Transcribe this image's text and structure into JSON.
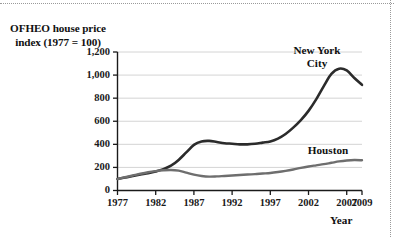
{
  "chart_data": {
    "type": "line",
    "title": "",
    "ylabel": "OFHEO house price index (1977 = 100)",
    "xlabel": "Year",
    "xlim": [
      1977,
      2009
    ],
    "ylim": [
      0,
      1200
    ],
    "grid": "horizontal",
    "legend_position": "inline-annotations",
    "xticks": [
      "1977",
      "1982",
      "1987",
      "1992",
      "1997",
      "2002",
      "2007",
      "2009"
    ],
    "xtick_values": [
      1977,
      1982,
      1987,
      1992,
      1997,
      2002,
      2007,
      2009
    ],
    "yticks": [
      "0",
      "200",
      "400",
      "600",
      "800",
      "1,000",
      "1,200"
    ],
    "ytick_values": [
      0,
      200,
      400,
      600,
      800,
      1000,
      1200
    ],
    "x": [
      1977,
      1978,
      1979,
      1980,
      1981,
      1982,
      1983,
      1984,
      1985,
      1986,
      1987,
      1988,
      1989,
      1990,
      1991,
      1992,
      1993,
      1994,
      1995,
      1996,
      1997,
      1998,
      1999,
      2000,
      2001,
      2002,
      2003,
      2004,
      2005,
      2006,
      2007,
      2008,
      2009
    ],
    "series": [
      {
        "name": "New York City",
        "color": "#2b2b2b",
        "values": [
          100,
          112,
          125,
          138,
          150,
          165,
          185,
          215,
          265,
          330,
          395,
          425,
          430,
          420,
          410,
          405,
          400,
          400,
          405,
          415,
          425,
          450,
          490,
          545,
          610,
          690,
          790,
          905,
          1010,
          1055,
          1040,
          975,
          915
        ]
      },
      {
        "name": "Houston",
        "color": "#6e6e6e",
        "values": [
          100,
          115,
          130,
          145,
          158,
          168,
          175,
          178,
          172,
          155,
          138,
          126,
          120,
          122,
          126,
          130,
          134,
          138,
          142,
          147,
          152,
          160,
          170,
          182,
          196,
          208,
          218,
          228,
          240,
          252,
          260,
          264,
          262
        ]
      }
    ],
    "annotations": [
      {
        "text": "New York City",
        "series": "New York City"
      },
      {
        "text": "Houston",
        "series": "Houston"
      }
    ]
  },
  "labels": {
    "y_axis_title_line1": "OFHEO house price",
    "y_axis_title_line2": "index (1977 = 100)",
    "x_axis_title": "Year",
    "series_new_york_line1": "New York",
    "series_new_york_line2": "City",
    "series_houston": "Houston"
  },
  "colors": {
    "new_york_city": "#2b2b2b",
    "houston": "#6e6e6e",
    "axis": "#1a1a1a",
    "gridline": "#cfcfcf",
    "frame": "#9a9a9a",
    "background": "#ffffff"
  }
}
